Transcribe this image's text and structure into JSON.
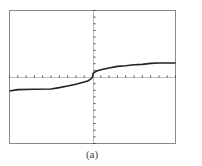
{
  "caption": "(a)",
  "colors": {
    "frame": "#8a8a8a",
    "axis": "#555555",
    "curve": "#222222",
    "background": "#ffffff"
  },
  "chart_data": {
    "type": "line",
    "title": "",
    "xlabel": "",
    "ylabel": "",
    "xlim": [
      -10,
      10
    ],
    "ylim": [
      -10,
      10
    ],
    "grid": false,
    "legend": null,
    "x_ticks_per_side": 10,
    "y_ticks_per_side": 10,
    "annotations": [
      "(a)"
    ],
    "series": [
      {
        "name": "f(x)",
        "points": [
          [
            -10,
            -2.1
          ],
          [
            -9,
            -1.9
          ],
          [
            -7,
            -1.85
          ],
          [
            -5,
            -1.8
          ],
          [
            -4,
            -1.6
          ],
          [
            -3,
            -1.35
          ],
          [
            -2,
            -1.1
          ],
          [
            -1,
            -0.75
          ],
          [
            -0.5,
            -0.55
          ],
          [
            -0.1,
            -0.2
          ],
          [
            0,
            0
          ],
          [
            0.1,
            0.6
          ],
          [
            0.5,
            0.9
          ],
          [
            1,
            1.1
          ],
          [
            2,
            1.35
          ],
          [
            3,
            1.6
          ],
          [
            4,
            1.7
          ],
          [
            5,
            1.85
          ],
          [
            6,
            1.9
          ],
          [
            7,
            2.05
          ],
          [
            8,
            2.1
          ],
          [
            9,
            2.1
          ],
          [
            10,
            2.1
          ]
        ]
      }
    ]
  }
}
